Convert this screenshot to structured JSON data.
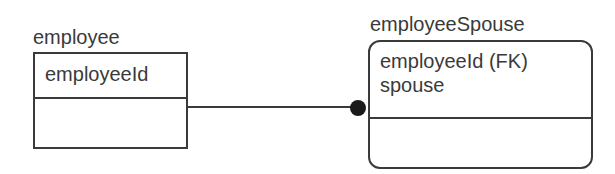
{
  "diagram": {
    "type": "IDEF1X entity relationship",
    "entities": [
      {
        "name": "employee",
        "kind": "independent",
        "attributes": [
          "employeeId"
        ],
        "non_key_attributes": []
      },
      {
        "name": "employeeSpouse",
        "kind": "dependent",
        "attributes": [
          "employeeId (FK)",
          "spouse"
        ],
        "non_key_attributes": []
      }
    ],
    "relationships": [
      {
        "from": "employee",
        "to": "employeeSpouse",
        "cardinality": "one-to-many",
        "end_marker": "filled-dot"
      }
    ],
    "colors": {
      "line": "#3a3a3a",
      "text": "#3a3a3a",
      "background": "#ffffff"
    }
  }
}
